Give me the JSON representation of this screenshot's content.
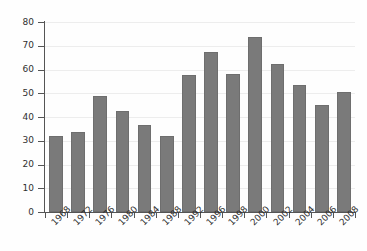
{
  "chart_data": {
    "type": "bar",
    "title": "",
    "subtitle": "",
    "xlabel": "",
    "ylabel": "",
    "categories": [
      "1968",
      "1972",
      "1976",
      "1980",
      "1984",
      "1988",
      "1992",
      "1996",
      "1998",
      "2000",
      "2002",
      "2004",
      "2006",
      "2008"
    ],
    "values": [
      32,
      33.5,
      49,
      42.5,
      36.5,
      32,
      57.5,
      67.5,
      58,
      73.5,
      62.5,
      53.5,
      45,
      50.5
    ],
    "series": [
      {
        "name": "",
        "values": [
          32,
          33.5,
          49,
          42.5,
          36.5,
          32,
          57.5,
          67.5,
          58,
          73.5,
          62.5,
          53.5,
          45,
          50.5
        ]
      }
    ],
    "ylim": [
      0,
      80
    ],
    "ytick_values": [
      0,
      10,
      20,
      30,
      40,
      50,
      60,
      70,
      80
    ],
    "ytick_labels": [
      "0",
      "10",
      "20",
      "30",
      "40",
      "50",
      "60",
      "70",
      "80"
    ],
    "xtick_labels": [
      "1968",
      "1972",
      "1976",
      "1980",
      "1984",
      "1988",
      "1992",
      "1996",
      "1998",
      "2000",
      "2002",
      "2004",
      "2006",
      "2008"
    ],
    "grid": true,
    "grid_axis": "y",
    "legend": false,
    "legend_position": "none",
    "annotations": [],
    "bar_color": "#7a7a7a",
    "bar_edge_color": "#6e6e6e",
    "grid_color": "#ededed",
    "axis_color": "#555555",
    "background_color": "#fefefe",
    "xtick_label_rotation": -45
  }
}
